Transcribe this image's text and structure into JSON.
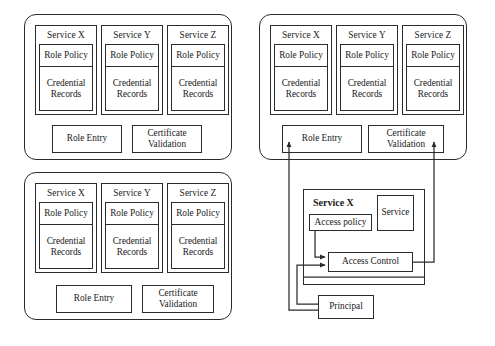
{
  "diagram": {
    "stroke_color": "#2b2b2b",
    "background_color": "#ffffff"
  },
  "labels": {
    "service_x": "Service X",
    "service_y": "Service Y",
    "service_z": "Service Z",
    "role_policy": "Role Policy",
    "credential_line1": "Credential",
    "credential_line2": "Records",
    "role_entry": "Role Entry",
    "certificate_line1": "Certificate",
    "certificate_line2": "Validation",
    "access_policy": "Access policy",
    "access_control": "Access Control",
    "service": "Service",
    "principal": "Principal",
    "service_x_bold": "Service X"
  },
  "panels": [
    {
      "id": "panel-top-left",
      "services": [
        {
          "name": "Service X",
          "role_policy": "Role Policy",
          "credential": [
            "Credential",
            "Records"
          ]
        },
        {
          "name": "Service Y",
          "role_policy": "Role Policy",
          "credential": [
            "Credential",
            "Records"
          ]
        },
        {
          "name": "Service Z",
          "role_policy": "Role Policy",
          "credential": [
            "Credential",
            "Records"
          ]
        }
      ],
      "footer_boxes": [
        {
          "lines": [
            "Role Entry"
          ]
        },
        {
          "lines": [
            "Certificate",
            "Validation"
          ]
        }
      ]
    },
    {
      "id": "panel-bottom-left",
      "services": [
        {
          "name": "Service X",
          "role_policy": "Role Policy",
          "credential": [
            "Credential",
            "Records"
          ]
        },
        {
          "name": "Service Y",
          "role_policy": "Role Policy",
          "credential": [
            "Credential",
            "Records"
          ]
        },
        {
          "name": "Service Z",
          "role_policy": "Role Policy",
          "credential": [
            "Credential",
            "Records"
          ]
        }
      ],
      "footer_boxes": [
        {
          "lines": [
            "Role Entry"
          ]
        },
        {
          "lines": [
            "Certificate",
            "Validation"
          ]
        }
      ]
    },
    {
      "id": "panel-top-right",
      "services": [
        {
          "name": "Service X",
          "role_policy": "Role Policy",
          "credential": [
            "Credential",
            "Records"
          ]
        },
        {
          "name": "Service Y",
          "role_policy": "Role Policy",
          "credential": [
            "Credential",
            "Records"
          ]
        },
        {
          "name": "Service Z",
          "role_policy": "Role Policy",
          "credential": [
            "Credential",
            "Records"
          ]
        }
      ],
      "footer_boxes": [
        {
          "lines": [
            "Role Entry"
          ]
        },
        {
          "lines": [
            "Certificate",
            "Validation"
          ]
        }
      ]
    }
  ],
  "detail": {
    "container_label": "Service X",
    "access_policy": "Access policy",
    "service": "Service",
    "access_control": "Access Control",
    "principal": "Principal"
  },
  "connections": [
    {
      "from": "Principal",
      "to": "Role Entry",
      "arrow": true
    },
    {
      "from": "Principal",
      "to": "Access Control",
      "arrow": true
    },
    {
      "from": "Access policy",
      "to": "Access Control",
      "arrow": true
    },
    {
      "from": "Access Control",
      "to": "Certificate Validation",
      "arrow": true
    }
  ]
}
